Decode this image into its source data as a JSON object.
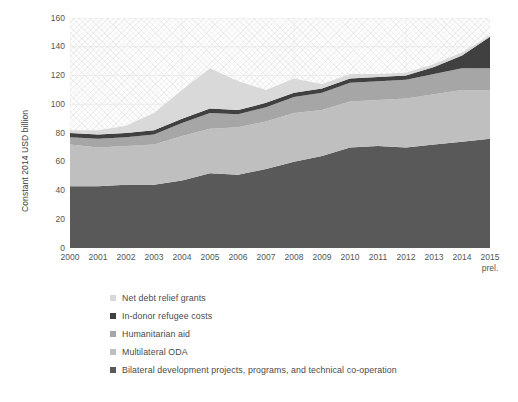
{
  "chart_data": {
    "type": "area",
    "title": "",
    "xlabel": "",
    "ylabel": "Constant 2014 USD billion",
    "ylim": [
      0,
      160
    ],
    "yticks": [
      0,
      20,
      40,
      60,
      80,
      100,
      120,
      140,
      160
    ],
    "grid": true,
    "stacked": true,
    "legend_position": "bottom-left",
    "categories": [
      "2000",
      "2001",
      "2002",
      "2003",
      "2004",
      "2005",
      "2006",
      "2007",
      "2008",
      "2009",
      "2010",
      "2011",
      "2012",
      "2013",
      "2014",
      "2015"
    ],
    "x_tick_sublabels": [
      "",
      "",
      "",
      "",
      "",
      "",
      "",
      "",
      "",
      "",
      "",
      "",
      "",
      "",
      "",
      "prel."
    ],
    "series": [
      {
        "name": "Bilateral development projects, programs, and technical co-operation",
        "color": "#595959",
        "values": [
          43,
          43,
          44,
          44,
          47,
          52,
          51,
          55,
          60,
          64,
          70,
          71,
          70,
          72,
          74,
          76
        ]
      },
      {
        "name": "Multilateral ODA",
        "color": "#bfbfbf",
        "values": [
          29,
          27,
          27,
          28,
          31,
          31,
          33,
          33,
          34,
          32,
          32,
          32,
          34,
          35,
          36,
          34
        ]
      },
      {
        "name": "Humanitarian aid",
        "color": "#a6a6a6",
        "values": [
          5,
          6,
          6,
          7,
          9,
          11,
          9,
          10,
          11,
          12,
          13,
          13,
          13,
          14,
          15,
          15
        ]
      },
      {
        "name": "In-donor refugee costs",
        "color": "#404040",
        "values": [
          3,
          3,
          3,
          3,
          3,
          3,
          3,
          3,
          3,
          3,
          3,
          3,
          3,
          5,
          9,
          22
        ]
      },
      {
        "name": "Net debt relief grants",
        "color": "#d9d9d9",
        "values": [
          2,
          3,
          5,
          12,
          20,
          28,
          20,
          9,
          10,
          3,
          3,
          2,
          2,
          2,
          2,
          1
        ]
      }
    ],
    "legend_order": [
      "Net debt relief grants",
      "In-donor refugee costs",
      "Humanitarian aid",
      "Multilateral ODA",
      "Bilateral development projects, programs, and technical co-operation"
    ],
    "totals": [
      82,
      82,
      85,
      94,
      110,
      125,
      116,
      110,
      118,
      114,
      121,
      121,
      122,
      128,
      136,
      148
    ]
  },
  "legend": [
    {
      "label": "Net debt relief grants",
      "color": "#d9d9d9"
    },
    {
      "label": "In-donor refugee costs",
      "color": "#404040"
    },
    {
      "label": "Humanitarian aid",
      "color": "#a6a6a6"
    },
    {
      "label": "Multilateral ODA",
      "color": "#bfbfbf"
    },
    {
      "label": "Bilateral development projects, programs, and technical co-operation",
      "color": "#595959"
    }
  ]
}
